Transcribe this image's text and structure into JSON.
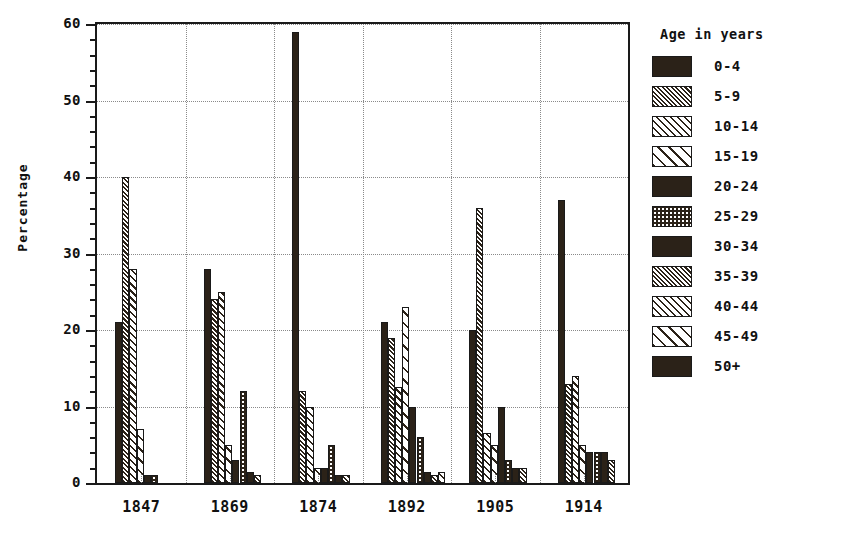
{
  "chart_data": {
    "type": "bar",
    "title": "",
    "xlabel": "",
    "ylabel": "Percentage",
    "ylim": [
      0,
      60
    ],
    "ytick_labels": [
      "0",
      "10",
      "20",
      "30",
      "40",
      "50",
      "60"
    ],
    "ytick_values": [
      0,
      10,
      20,
      30,
      40,
      50,
      60
    ],
    "minor_tick_step": 2,
    "grid": true,
    "legend_position": "right",
    "legend_title": "Age in years",
    "categories": [
      "1847",
      "1869",
      "1874",
      "1892",
      "1905",
      "1914"
    ],
    "series": [
      {
        "name": "0-4",
        "pattern": "solid",
        "values": [
          21,
          28,
          59,
          21,
          20,
          37
        ]
      },
      {
        "name": "5-9",
        "pattern": "dense-hatch",
        "values": [
          40,
          24,
          12,
          19,
          36,
          13
        ]
      },
      {
        "name": "10-14",
        "pattern": "medium-hatch",
        "values": [
          28,
          25,
          10,
          12.5,
          6.5,
          14
        ]
      },
      {
        "name": "15-19",
        "pattern": "wide-hatch",
        "values": [
          7,
          5,
          2,
          23,
          5,
          5
        ]
      },
      {
        "name": "20-24",
        "pattern": "solid",
        "values": [
          1,
          3,
          2,
          10,
          10,
          4
        ]
      },
      {
        "name": "25-29",
        "pattern": "dots",
        "values": [
          1,
          12,
          5,
          6,
          3,
          4
        ]
      },
      {
        "name": "30-34",
        "pattern": "solid",
        "values": [
          0,
          1.5,
          1,
          1.5,
          2,
          4
        ]
      },
      {
        "name": "35-39",
        "pattern": "dense-hatch",
        "values": [
          0,
          1,
          1,
          1,
          2,
          3
        ]
      },
      {
        "name": "40-44",
        "pattern": "medium-hatch",
        "values": [
          0,
          0,
          0,
          1.5,
          0,
          0
        ]
      },
      {
        "name": "45-49",
        "pattern": "wide-hatch",
        "values": [
          0,
          0,
          0,
          0,
          0,
          0
        ]
      },
      {
        "name": "50+",
        "pattern": "solid",
        "values": [
          0,
          0,
          0,
          0,
          0,
          0
        ]
      }
    ]
  },
  "colors": {
    "ink": "#1a1a1a",
    "fill": "#2b2218",
    "grid": "#8a8a8a",
    "background": "#ffffff"
  }
}
